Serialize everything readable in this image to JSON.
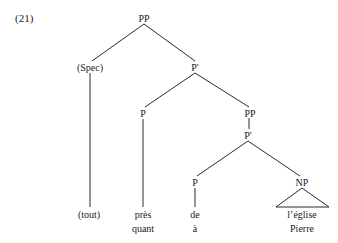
{
  "example_number": "(21)",
  "tree": {
    "nodes": {
      "root_pp": "PP",
      "spec": "(Spec)",
      "p_bar_upper": "P'",
      "p_head_upper": "P",
      "pp_inner": "PP",
      "p_bar_lower": "P'",
      "p_head_lower": "P",
      "np": "NP"
    },
    "leaves": {
      "spec_word": "(tout)",
      "p_upper_word_1": "près",
      "p_upper_word_2": "quant",
      "p_lower_word_1": "de",
      "p_lower_word_2": "à",
      "np_word_1": "l’église",
      "np_word_2": "Pierre"
    }
  }
}
